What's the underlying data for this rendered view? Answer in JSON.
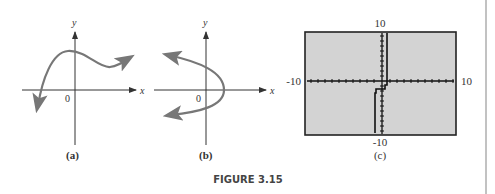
{
  "figure": {
    "caption": "FIGURE 3.15",
    "border_color": "#888888"
  },
  "panels": [
    {
      "id": "a",
      "label": "(a)",
      "x_axis_label": "x",
      "y_axis_label": "y",
      "origin_label": "0",
      "curve": "cubic-like curve rising from lower-left, local max near y-axis, local min, then rising right",
      "curve_color": "#777777"
    },
    {
      "id": "b",
      "label": "(b)",
      "x_axis_label": "x",
      "y_axis_label": "y",
      "origin_label": "0",
      "curve": "parabola opening to the left with vertex on positive x-axis",
      "curve_color": "#777777"
    },
    {
      "id": "c",
      "label": "(c)",
      "window": {
        "xmin_label": "-10",
        "xmax_label": "10",
        "ymin_label": "-10",
        "ymax_label": "10"
      },
      "screen_color": "#d3d3d3",
      "curve": "calculator step graph near y-axis",
      "curve_color": "#111111"
    }
  ]
}
